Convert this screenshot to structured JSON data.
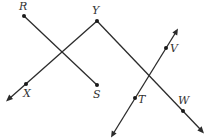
{
  "diagram": {
    "type": "geometry-lines",
    "points": {
      "R": {
        "label": "R",
        "x": 24,
        "y": 16
      },
      "S": {
        "label": "S",
        "x": 97,
        "y": 85
      },
      "Y": {
        "label": "Y",
        "x": 97,
        "y": 21
      },
      "X": {
        "label": "X",
        "x": 26,
        "y": 84
      },
      "W": {
        "label": "W",
        "x": 183,
        "y": 111
      },
      "V": {
        "label": "V",
        "x": 166,
        "y": 48
      },
      "T": {
        "label": "T",
        "x": 135,
        "y": 98
      }
    },
    "segments": [
      {
        "name": "segment-RS",
        "from": "R",
        "to": "S",
        "type": "segment"
      },
      {
        "name": "ray-YX",
        "from": "Y",
        "through": "X",
        "type": "ray"
      },
      {
        "name": "ray-YW",
        "from": "Y",
        "through": "W",
        "type": "ray"
      },
      {
        "name": "line-TV",
        "through": [
          "T",
          "V"
        ],
        "type": "line"
      }
    ],
    "colors": {
      "stroke": "#2b2b2b",
      "label": "#333333"
    }
  }
}
